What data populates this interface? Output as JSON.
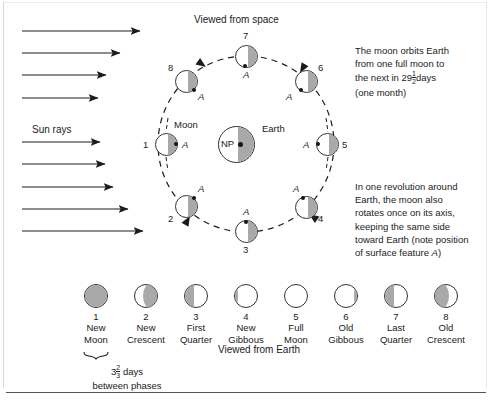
{
  "figure": {
    "title_space": "Viewed from space",
    "title_earth": "Viewed from Earth",
    "sun_rays_label": "Sun rays",
    "moon_label": "Moon",
    "earth_label": "Earth",
    "north_pole_label": "NP",
    "feature_label": "A",
    "note_orbit": {
      "line1": "The moon orbits Earth",
      "line2": "from one full moon to",
      "line3_pre": "the next in 29",
      "line3_frac_num": "1",
      "line3_frac_den": "2",
      "line3_post": "days",
      "line4": "(one month)"
    },
    "note_rotation": {
      "line1": "In one revolution around",
      "line2": "Earth, the moon also",
      "line3": "rotates once on its axis,",
      "line4": "keeping the same side",
      "line5": "toward Earth (note position",
      "line6_pre": "of surface feature ",
      "line6_em": "A",
      "line6_post": ")"
    },
    "between_phases": {
      "whole": "3",
      "frac_num": "2",
      "frac_den": "3",
      "unit": "days",
      "line2": "between phases"
    },
    "colors": {
      "shadow": "#a9a9a9",
      "outline": "#33312f",
      "lit": "#ffffff",
      "ink": "#1c1c1c"
    },
    "orbit_moons": [
      {
        "number": "1",
        "shade": "right",
        "feature_side": "right",
        "num_pos": "left",
        "alpha_pos": "right"
      },
      {
        "number": "2",
        "shade": "right",
        "feature_side": "top",
        "num_pos": "bottom-left",
        "alpha_pos": "top"
      },
      {
        "number": "3",
        "shade": "right",
        "feature_side": "top",
        "num_pos": "bottom",
        "alpha_pos": "top"
      },
      {
        "number": "4",
        "shade": "right",
        "feature_side": "top",
        "num_pos": "bottom-right",
        "alpha_pos": "top-left"
      },
      {
        "number": "5",
        "shade": "right",
        "feature_side": "left",
        "num_pos": "right",
        "alpha_pos": "left"
      },
      {
        "number": "6",
        "shade": "right",
        "feature_side": "bottom",
        "num_pos": "top-right",
        "alpha_pos": "bottom-left"
      },
      {
        "number": "7",
        "shade": "right",
        "feature_side": "bottom",
        "num_pos": "top",
        "alpha_pos": "bottom"
      },
      {
        "number": "8",
        "shade": "right",
        "feature_side": "bottom",
        "num_pos": "top-left",
        "alpha_pos": "bottom-right"
      }
    ],
    "sun_ray_count": 9,
    "phases": [
      {
        "number": "1",
        "name_line1": "New",
        "name_line2": "Moon",
        "shade": "full"
      },
      {
        "number": "2",
        "name_line1": "New",
        "name_line2": "Crescent",
        "shade": "cresc-r"
      },
      {
        "number": "3",
        "name_line1": "First",
        "name_line2": "Quarter",
        "shade": "left"
      },
      {
        "number": "4",
        "name_line1": "New",
        "name_line2": "Gibbous",
        "shade": "gib-l"
      },
      {
        "number": "5",
        "name_line1": "Full",
        "name_line2": "Moon",
        "shade": "none"
      },
      {
        "number": "6",
        "name_line1": "Old",
        "name_line2": "Gibbous",
        "shade": "gib-r"
      },
      {
        "number": "7",
        "name_line1": "Last",
        "name_line2": "Quarter",
        "shade": "left"
      },
      {
        "number": "8",
        "name_line1": "Old",
        "name_line2": "Crescent",
        "shade": "cresc-l"
      }
    ]
  }
}
